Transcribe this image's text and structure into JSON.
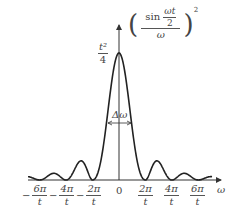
{
  "chart_data": {
    "type": "line",
    "title": "",
    "function": "(sin(ωt/2)/ω)^2",
    "ylabel": "(sin(ωt/2)/ω)^2",
    "xlabel": "ω",
    "peak_label": "t²/4",
    "width_label": "Δω",
    "x_ticks": [
      "-6π/t",
      "-4π/t",
      "-2π/t",
      "0",
      "2π/t",
      "4π/t",
      "6π/t"
    ],
    "zeros": [
      "-6π/t",
      "-4π/t",
      "-2π/t",
      "2π/t",
      "4π/t",
      "6π/t"
    ],
    "peak": {
      "x": "0",
      "y": "t²/4"
    }
  },
  "labels": {
    "ylabel_sin": "sin",
    "ylabel_num": "ωt",
    "ylabel_den2": "2",
    "ylabel_den": "ω",
    "ylabel_exp": "2",
    "peak_num": "t²",
    "peak_den": "4",
    "width": "Δω",
    "xaxis": "ω",
    "ticks": [
      {
        "sign": "−",
        "num": "6π",
        "den": "t"
      },
      {
        "sign": "−",
        "num": "4π",
        "den": "t"
      },
      {
        "sign": "−",
        "num": "2π",
        "den": "t"
      },
      {
        "sign": "",
        "num": "0",
        "den": ""
      },
      {
        "sign": "",
        "num": "2π",
        "den": "t"
      },
      {
        "sign": "",
        "num": "4π",
        "den": "t"
      },
      {
        "sign": "",
        "num": "6π",
        "den": "t"
      }
    ]
  }
}
